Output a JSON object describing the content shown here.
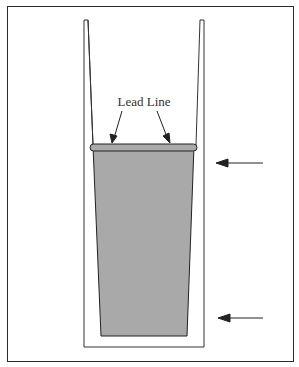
{
  "diagram": {
    "label": "Lead Line",
    "colors": {
      "frame": "#2a2a2a",
      "fill": "#a9a9a9",
      "stroke": "#222222",
      "background": "#ffffff"
    },
    "arrows": [
      {
        "name": "upper-arrow",
        "points_to": "rim level"
      },
      {
        "name": "lower-arrow",
        "points_to": "bottom level"
      }
    ]
  }
}
